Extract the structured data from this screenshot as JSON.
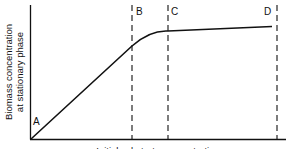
{
  "diagram": {
    "y_axis_label_line1": "Biomass concentration",
    "y_axis_label_line2": "at stationary phase",
    "x_axis_label": "Initial substrate concentration",
    "points": {
      "A": "A",
      "B": "B",
      "C": "C",
      "D": "D"
    },
    "colors": {
      "line": "#111111",
      "background": "#ffffff"
    }
  }
}
